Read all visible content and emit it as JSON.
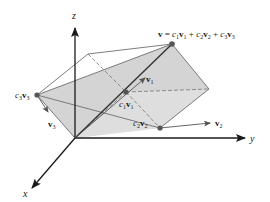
{
  "diagram": {
    "axes": {
      "x_label": "x",
      "y_label": "y",
      "z_label": "z"
    },
    "equation": {
      "lhs": "v",
      "eq": " = ",
      "c1": "c",
      "s1": "1",
      "v1": "v",
      "plus1": " + ",
      "c2": "c",
      "s2": "2",
      "v2": "v",
      "plus2": " + ",
      "c3": "c",
      "s3": "3",
      "v3": "v"
    },
    "labels": {
      "v1": {
        "base": "v",
        "sub": "1"
      },
      "v2": {
        "base": "v",
        "sub": "2"
      },
      "v3": {
        "base": "v",
        "sub": "3"
      },
      "c1v1": {
        "c": "c",
        "csub": "1",
        "v": "v",
        "vsub": "1"
      },
      "c2v2": {
        "c": "c",
        "csub": "2",
        "v": "v",
        "vsub": "2"
      },
      "c3v3": {
        "c": "c",
        "csub": "3",
        "v": "v",
        "vsub": "3"
      }
    },
    "colors": {
      "shade": "#c8c8c8",
      "shade_light": "#dcdcdc",
      "edge": "#6e6e6e",
      "axis": "#1a1a1a",
      "point": "#555555"
    }
  }
}
